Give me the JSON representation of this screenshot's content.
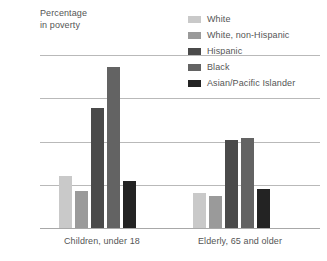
{
  "chart_data": {
    "type": "bar",
    "title": "",
    "axis_title_lines": [
      "Percentage",
      "in poverty"
    ],
    "ylabel": "Percentage in poverty",
    "xlabel": "",
    "categories": [
      "Children, under 18",
      "Elderly, 65 and older"
    ],
    "series": [
      {
        "name": "White",
        "values": [
          12.1,
          8.0
        ],
        "color": "#c9c9c9"
      },
      {
        "name": "White, non-Hispanic",
        "values": [
          8.6,
          7.3
        ],
        "color": "#9a9a9a"
      },
      {
        "name": "Hispanic",
        "values": [
          27.8,
          20.4
        ],
        "color": "#4a4a4a"
      },
      {
        "name": "Black",
        "values": [
          37.2,
          20.8
        ],
        "color": "#636363"
      },
      {
        "name": "Asian/Pacific Islander",
        "values": [
          10.8,
          9.0
        ],
        "color": "#232323"
      }
    ],
    "ylim": [
      0,
      40
    ],
    "yticks": [
      40,
      30,
      20,
      10,
      0
    ],
    "ytick_labels": [
      "40",
      "30",
      "20",
      "10",
      "0"
    ],
    "grid": true,
    "legend_position": "top-right"
  },
  "colors": {
    "text": "#555555",
    "gridline": "#b9b9b9",
    "baseline": "#a8a8a8",
    "background": "#ffffff"
  }
}
